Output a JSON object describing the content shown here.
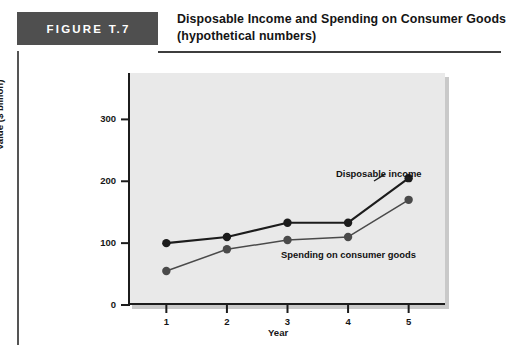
{
  "figure": {
    "tag": "FIGURE T.7",
    "title_line1": "Disposable Income and Spending on Consumer Goods",
    "title_line2": "(hypothetical numbers)"
  },
  "chart_data": {
    "type": "line",
    "title": "Disposable Income and Spending on Consumer Goods (hypothetical numbers)",
    "xlabel": "Year",
    "ylabel": "Value ($ billion)",
    "x": [
      1,
      2,
      3,
      4,
      5
    ],
    "xtick_labels": [
      "1",
      "2",
      "3",
      "4",
      "5"
    ],
    "ytick_labels": [
      "0",
      "100",
      "200",
      "300"
    ],
    "yticks": [
      0,
      100,
      200,
      300
    ],
    "xlim": [
      0.4,
      5.6
    ],
    "ylim": [
      0,
      375
    ],
    "grid": false,
    "legend_position": "inline-annotations",
    "series": [
      {
        "name": "Disposable income",
        "values": [
          100,
          110,
          133,
          133,
          205
        ],
        "color": "#1c1c1c",
        "marker": "circle"
      },
      {
        "name": "Spending on consumer goods",
        "values": [
          55,
          90,
          105,
          110,
          170
        ],
        "color": "#4a4a4a",
        "marker": "circle"
      }
    ],
    "annotations": [
      {
        "text": "Disposable income",
        "series": "Disposable income"
      },
      {
        "text": "Spending on consumer goods",
        "series": "Spending on consumer goods"
      }
    ]
  },
  "colors": {
    "tag_background": "#4f4f4f",
    "panel_background": "#e9e9e9",
    "axis": "#1c1c1c",
    "rule": "#3d3d3d"
  }
}
